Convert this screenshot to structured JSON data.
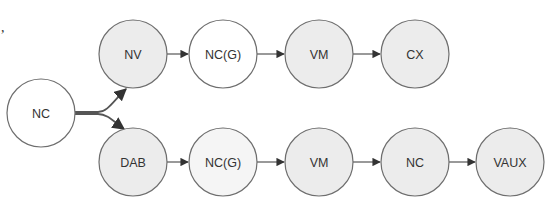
{
  "diagram": {
    "type": "flow",
    "stray_mark": ",",
    "colors": {
      "stroke": "#6e6e6e",
      "fill_white": "#ffffff",
      "fill_grey": "#ececec",
      "fill_light": "#f5f5f5",
      "arrow": "#333333"
    },
    "nodes": [
      {
        "id": "nc-start",
        "label": "NC",
        "cx": 41,
        "cy": 113,
        "fill": "#ffffff"
      },
      {
        "id": "nv",
        "label": "NV",
        "cx": 133,
        "cy": 54,
        "fill": "#ececec"
      },
      {
        "id": "ncg-top",
        "label": "NC(G)",
        "cx": 223,
        "cy": 54,
        "fill": "#ffffff"
      },
      {
        "id": "vm-top",
        "label": "VM",
        "cx": 319,
        "cy": 54,
        "fill": "#ececec"
      },
      {
        "id": "cx",
        "label": "CX",
        "cx": 415,
        "cy": 54,
        "fill": "#ececec"
      },
      {
        "id": "dab",
        "label": "DAB",
        "cx": 133,
        "cy": 162,
        "fill": "#ececec"
      },
      {
        "id": "ncg-bottom",
        "label": "NC(G)",
        "cx": 223,
        "cy": 162,
        "fill": "#f5f5f5"
      },
      {
        "id": "vm-bottom",
        "label": "VM",
        "cx": 319,
        "cy": 162,
        "fill": "#ececec"
      },
      {
        "id": "nc-bottom",
        "label": "NC",
        "cx": 415,
        "cy": 162,
        "fill": "#ececec"
      },
      {
        "id": "vaux",
        "label": "VAUX",
        "cx": 510,
        "cy": 162,
        "fill": "#ececec"
      }
    ],
    "edges": [
      {
        "from": "nc-start",
        "to": "nv"
      },
      {
        "from": "nc-start",
        "to": "dab"
      },
      {
        "from": "nv",
        "to": "ncg-top"
      },
      {
        "from": "ncg-top",
        "to": "vm-top"
      },
      {
        "from": "vm-top",
        "to": "cx"
      },
      {
        "from": "dab",
        "to": "ncg-bottom"
      },
      {
        "from": "ncg-bottom",
        "to": "vm-bottom"
      },
      {
        "from": "vm-bottom",
        "to": "nc-bottom"
      },
      {
        "from": "nc-bottom",
        "to": "vaux"
      }
    ]
  }
}
